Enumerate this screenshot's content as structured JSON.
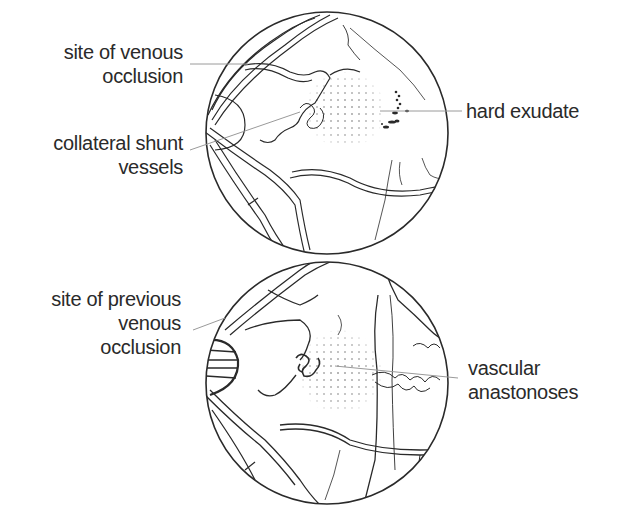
{
  "top_panel": {
    "labels": {
      "site_of_venous_occlusion": [
        "site of venous",
        "occlusion"
      ],
      "collateral_shunt_vessels": [
        "collateral shunt",
        "vessels"
      ],
      "hard_exudate": "hard exudate"
    }
  },
  "bottom_panel": {
    "labels": {
      "site_of_previous_venous_occlusion": [
        "site of previous",
        "venous",
        "occlusion"
      ],
      "vascular_anastonoses": [
        "vascular",
        "anastonoses"
      ]
    }
  },
  "colors": {
    "line": "#2a2a2a",
    "leader": "#9a9a9a",
    "background": "#ffffff"
  }
}
